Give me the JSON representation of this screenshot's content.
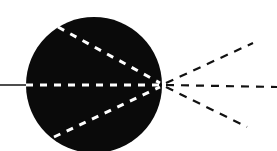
{
  "diagram": {
    "type": "optics-lens-ray-diagram",
    "background": "#ffffff",
    "lens": {
      "shape": "circle",
      "fill": "#0a0a0a",
      "cx": 94,
      "cy": 85,
      "r": 68
    },
    "incoming_ray": {
      "style": "solid",
      "color": "#222222",
      "x1": 0,
      "y1": 85,
      "x2": 26,
      "y2": 85
    },
    "inner_rays": {
      "style": "dashed",
      "color": "#ffffff",
      "lines": [
        {
          "x1": 58,
          "y1": 27,
          "x2": 160,
          "y2": 83
        },
        {
          "x1": 26,
          "y1": 85,
          "x2": 160,
          "y2": 85
        },
        {
          "x1": 54,
          "y1": 137,
          "x2": 160,
          "y2": 87
        }
      ]
    },
    "focal_point": {
      "x": 163,
      "y": 85
    },
    "outgoing_rays": {
      "style": "dashed",
      "color": "#111111",
      "lines": [
        {
          "x1": 166,
          "y1": 83,
          "x2": 253,
          "y2": 43
        },
        {
          "x1": 166,
          "y1": 85,
          "x2": 277,
          "y2": 87
        },
        {
          "x1": 166,
          "y1": 87,
          "x2": 247,
          "y2": 127
        }
      ]
    }
  }
}
